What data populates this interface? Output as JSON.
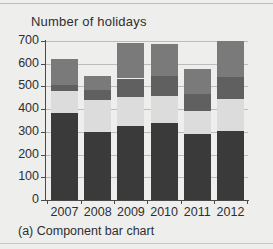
{
  "figure": {
    "title": "Number of holidays",
    "caption": "(a) Component bar chart"
  },
  "axes": {
    "y_ticks": [
      "700",
      "600",
      "500",
      "400",
      "300",
      "200",
      "100",
      "0"
    ],
    "x_ticks": [
      "2007",
      "2008",
      "2009",
      "2010",
      "2011",
      "2012"
    ]
  },
  "colors": {
    "segment_1": "#3a3a3a",
    "segment_2": "#dcdcdc",
    "segment_3": "#606060",
    "segment_4": "#7a7a7a",
    "background": "#eeeeec",
    "gridline": "#bcbcba",
    "axis": "#4a4a4a",
    "text": "#2f2f2f"
  },
  "chart_data": {
    "type": "bar",
    "title": "Number of holidays",
    "xlabel": "",
    "ylabel": "Number of holidays",
    "ylim": [
      0,
      700
    ],
    "ytick_step": 100,
    "grid": true,
    "stacked": true,
    "legend": "none",
    "categories": [
      "2007",
      "2008",
      "2009",
      "2010",
      "2011",
      "2012"
    ],
    "series": [
      {
        "name": "Segment 1",
        "color": "#3a3a3a",
        "values": [
          385,
          300,
          328,
          340,
          292,
          302
        ]
      },
      {
        "name": "Segment 2",
        "color": "#dcdcdc",
        "values": [
          95,
          140,
          127,
          120,
          98,
          141
        ]
      },
      {
        "name": "Segment 3",
        "color": "#606060",
        "values": [
          28,
          45,
          80,
          85,
          78,
          97
        ]
      },
      {
        "name": "Segment 4",
        "color": "#7a7a7a",
        "values": [
          112,
          62,
          155,
          140,
          109,
          160
        ]
      }
    ],
    "cumulative_tops": {
      "2007": [
        385,
        480,
        508,
        620
      ],
      "2008": [
        300,
        440,
        485,
        547
      ],
      "2009": [
        328,
        455,
        535,
        690
      ],
      "2010": [
        340,
        460,
        545,
        685
      ],
      "2011": [
        292,
        390,
        468,
        577
      ],
      "2012": [
        302,
        443,
        540,
        700
      ]
    },
    "totals": [
      620,
      547,
      690,
      685,
      577,
      700
    ]
  }
}
